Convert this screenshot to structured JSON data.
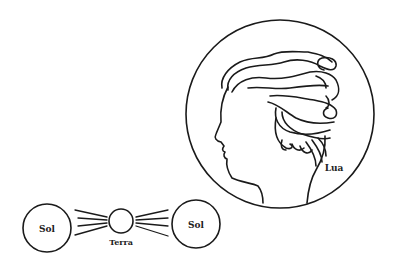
{
  "diagram": {
    "labels": {
      "sol_left": "Sol",
      "terra": "Terra",
      "sol_right": "Sol",
      "lua": "Lua"
    },
    "colors": {
      "line": "#1a1a1a",
      "background": "#ffffff"
    }
  }
}
